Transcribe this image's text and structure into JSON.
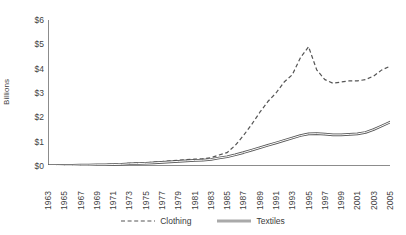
{
  "chart_data": {
    "type": "line",
    "title": "",
    "xlabel": "",
    "ylabel": "Billions",
    "ylim": [
      0,
      6
    ],
    "ytick_labels": [
      "$6",
      "$5",
      "$4",
      "$3",
      "$2",
      "$1",
      "$0"
    ],
    "ytick_values": [
      6,
      5,
      4,
      3,
      2,
      1,
      0
    ],
    "xlim": [
      1963,
      2005
    ],
    "grid": false,
    "legend_position": "bottom-center",
    "x": [
      1963,
      1964,
      1965,
      1966,
      1967,
      1968,
      1969,
      1970,
      1971,
      1972,
      1973,
      1974,
      1975,
      1976,
      1977,
      1978,
      1979,
      1980,
      1981,
      1982,
      1983,
      1984,
      1985,
      1986,
      1987,
      1988,
      1989,
      1990,
      1991,
      1992,
      1993,
      1994,
      1995,
      1996,
      1997,
      1998,
      1999,
      2000,
      2001,
      2002,
      2003,
      2004,
      2005
    ],
    "xtick_labels": [
      "1963",
      "1965",
      "1967",
      "1969",
      "1971",
      "1973",
      "1975",
      "1977",
      "1979",
      "1981",
      "1983",
      "1985",
      "1987",
      "1989",
      "1991",
      "1993",
      "1995",
      "1997",
      "1999",
      "2001",
      "2003",
      "2005"
    ],
    "series": [
      {
        "name": "Clothing",
        "style": "dashed",
        "color": "#555555",
        "values": [
          0.02,
          0.02,
          0.03,
          0.03,
          0.04,
          0.05,
          0.05,
          0.06,
          0.07,
          0.09,
          0.11,
          0.12,
          0.13,
          0.16,
          0.18,
          0.21,
          0.24,
          0.26,
          0.28,
          0.3,
          0.34,
          0.45,
          0.55,
          0.85,
          1.25,
          1.7,
          2.2,
          2.65,
          3.0,
          3.45,
          3.75,
          4.45,
          4.9,
          3.95,
          3.55,
          3.4,
          3.45,
          3.5,
          3.5,
          3.55,
          3.7,
          3.95,
          4.1
        ]
      },
      {
        "name": "Textiles",
        "style": "solid",
        "color": "#555555",
        "values": [
          0.02,
          0.02,
          0.03,
          0.03,
          0.04,
          0.04,
          0.05,
          0.05,
          0.06,
          0.07,
          0.09,
          0.1,
          0.11,
          0.13,
          0.15,
          0.17,
          0.19,
          0.21,
          0.23,
          0.24,
          0.27,
          0.33,
          0.38,
          0.46,
          0.55,
          0.65,
          0.75,
          0.85,
          0.95,
          1.05,
          1.15,
          1.25,
          1.32,
          1.33,
          1.31,
          1.28,
          1.28,
          1.3,
          1.32,
          1.38,
          1.5,
          1.65,
          1.8
        ]
      }
    ]
  },
  "legend": {
    "items": [
      {
        "label": "Clothing",
        "style": "dashed"
      },
      {
        "label": "Textiles",
        "style": "solid"
      }
    ]
  }
}
